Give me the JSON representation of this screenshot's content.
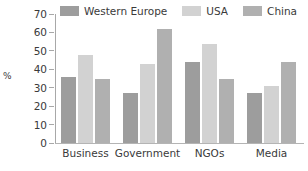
{
  "chart_data": {
    "type": "bar",
    "title": "",
    "subtitle": "",
    "xlabel": "",
    "ylabel": "%",
    "categories": [
      "Business",
      "Government",
      "NGOs",
      "Media"
    ],
    "series": [
      {
        "name": "Western Europe",
        "color": "#9d9d9d",
        "values": [
          36,
          27,
          44,
          27
        ]
      },
      {
        "name": "USA",
        "color": "#d2d2d2",
        "values": [
          48,
          43,
          54,
          31
        ]
      },
      {
        "name": "China",
        "color": "#b0b0b0",
        "values": [
          35,
          62,
          35,
          44
        ]
      }
    ],
    "ylim": [
      0,
      70
    ],
    "ytick_step": 10,
    "yticks": [
      0,
      10,
      20,
      30,
      40,
      50,
      60,
      70
    ],
    "ytick_labels": [
      "0",
      "10",
      "20",
      "30",
      "40",
      "50",
      "60",
      "70"
    ],
    "grid": false,
    "legend_position": "top",
    "orientation": "vertical",
    "bar_mode": "grouped"
  },
  "axis": {
    "y_title": "%",
    "axis_color": "#a8a8a8",
    "baseline_color": "#b4b4b4",
    "text_color": "#3a3a3a"
  },
  "legend": {
    "items": [
      {
        "label": "Western Europe",
        "color": "#9d9d9d"
      },
      {
        "label": "USA",
        "color": "#d2d2d2"
      },
      {
        "label": "China",
        "color": "#b0b0b0"
      }
    ]
  },
  "figure": {
    "background": "#ffffff"
  }
}
